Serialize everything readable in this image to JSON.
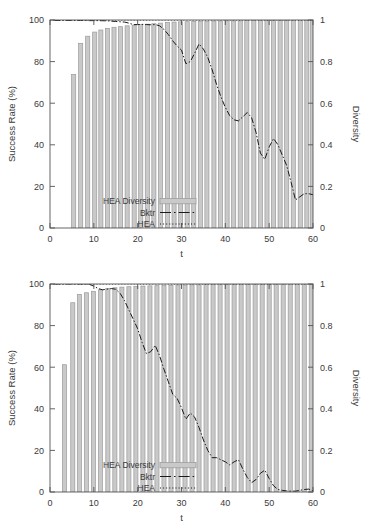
{
  "figure": {
    "background": "#ffffff",
    "bar_fill": "#c9c9c9",
    "bar_stroke": "#9a9a9a",
    "line_color": "#1a1a1a",
    "axis_color": "#555555",
    "text_color": "#3a3a3a"
  },
  "panels": [
    {
      "id": "top-panel",
      "legend": {
        "entries": [
          {
            "label": "HEA Diversity",
            "style": "filled-box"
          },
          {
            "label": "Bktr",
            "style": "dash-dot-line"
          },
          {
            "label": "HEA",
            "style": "dotted-line"
          }
        ]
      },
      "chart_data": {
        "type": "bar",
        "title": "",
        "xlabel": "t",
        "ylabel": "Success Rate (%)",
        "y2label": "Diversity",
        "xlim": [
          0,
          60
        ],
        "ylim": [
          0,
          100
        ],
        "y2lim": [
          0,
          1
        ],
        "xticks": [
          0,
          10,
          20,
          30,
          40,
          50,
          60
        ],
        "yticks": [
          0,
          20,
          40,
          60,
          80,
          100
        ],
        "y2ticks": [
          0,
          0.2,
          0.4,
          0.6,
          0.8,
          1
        ],
        "grid": false,
        "legend_position": "bottom-left",
        "series": [
          {
            "name": "HEA Diversity",
            "type": "bar",
            "axis": "right",
            "x": [
              5.4,
              7,
              8.6,
              10.2,
              11.6,
              13.1,
              14.6,
              16.1,
              17.6,
              19.2,
              20.7,
              22.2,
              23.7,
              25.2,
              26.8,
              28.3,
              29.8,
              31.3,
              32.8,
              34.3,
              35.8,
              37.4,
              38.9,
              40.4,
              41.9,
              43.4,
              44.9,
              46.5,
              48,
              49.5,
              51,
              52.5,
              54,
              55.5,
              57.1,
              58.6,
              59.9
            ],
            "values": [
              0.738,
              0.888,
              0.922,
              0.942,
              0.952,
              0.96,
              0.965,
              0.968,
              0.972,
              0.975,
              0.978,
              0.98,
              0.982,
              0.985,
              0.988,
              0.99,
              0.991,
              0.992,
              0.993,
              0.994,
              0.994,
              0.995,
              0.995,
              0.996,
              0.996,
              0.996,
              0.997,
              0.997,
              0.997,
              0.998,
              0.998,
              0.998,
              0.998,
              0.999,
              0.999,
              0.999,
              0.999
            ]
          },
          {
            "name": "Bktr",
            "type": "line",
            "axis": "right",
            "linestyle": "dash-dot",
            "x": [
              1,
              3,
              5,
              7,
              9,
              11,
              13,
              15,
              17,
              18,
              19,
              20,
              21,
              22,
              23,
              24,
              25,
              26,
              27,
              28,
              29,
              30,
              31,
              32,
              33,
              34,
              35,
              36,
              37,
              38,
              39,
              40,
              41,
              42,
              43,
              44,
              45,
              46,
              47,
              48,
              49,
              50,
              51,
              52,
              53,
              54,
              55,
              56,
              57,
              58,
              59,
              60
            ],
            "values": [
              0.998,
              0.998,
              0.998,
              0.998,
              0.997,
              0.997,
              0.996,
              0.993,
              0.99,
              0.985,
              0.978,
              0.978,
              0.979,
              0.978,
              0.977,
              0.978,
              0.972,
              0.955,
              0.93,
              0.9,
              0.875,
              0.855,
              0.79,
              0.8,
              0.84,
              0.885,
              0.86,
              0.82,
              0.76,
              0.69,
              0.63,
              0.58,
              0.54,
              0.52,
              0.515,
              0.535,
              0.555,
              0.53,
              0.46,
              0.36,
              0.33,
              0.39,
              0.43,
              0.4,
              0.35,
              0.3,
              0.22,
              0.135,
              0.15,
              0.165,
              0.165,
              0.16
            ]
          },
          {
            "name": "HEA",
            "type": "line",
            "axis": "right",
            "linestyle": "dotted",
            "x": [
              0,
              5,
              10,
              15,
              20,
              25,
              30,
              35,
              40,
              45,
              50,
              55,
              60
            ],
            "values": [
              1,
              1,
              1,
              1,
              1,
              1,
              1,
              1,
              1,
              1,
              1,
              1,
              1
            ]
          }
        ]
      }
    },
    {
      "id": "bottom-panel",
      "legend": {
        "entries": [
          {
            "label": "HEA Diversity",
            "style": "filled-box"
          },
          {
            "label": "Bktr",
            "style": "dash-dot-line"
          },
          {
            "label": "HEA",
            "style": "dotted-line"
          }
        ]
      },
      "chart_data": {
        "type": "bar",
        "title": "",
        "xlabel": "t",
        "ylabel": "Success Rate (%)",
        "y2label": "Diversity",
        "xlim": [
          0,
          60
        ],
        "ylim": [
          0,
          100
        ],
        "y2lim": [
          0,
          1
        ],
        "xticks": [
          0,
          10,
          20,
          30,
          40,
          50,
          60
        ],
        "yticks": [
          0,
          20,
          40,
          60,
          80,
          100
        ],
        "y2ticks": [
          0,
          0.2,
          0.4,
          0.6,
          0.8,
          1
        ],
        "grid": false,
        "legend_position": "bottom-left",
        "series": [
          {
            "name": "HEA Diversity",
            "type": "bar",
            "axis": "right",
            "x": [
              3.3,
              5.2,
              6.7,
              8.3,
              9.9,
              11.5,
              13.2,
              14.8,
              16.4,
              18,
              19.6,
              21.2,
              22.8,
              24.4,
              26,
              27.6,
              29.2,
              30.8,
              32.4,
              34,
              35.6,
              37.2,
              38.8,
              40.4,
              42,
              43.6,
              45.2,
              46.8,
              48.4,
              50,
              51.6,
              53.2,
              54.8,
              56.4,
              58,
              59.6
            ],
            "values": [
              0.612,
              0.91,
              0.95,
              0.958,
              0.965,
              0.972,
              0.978,
              0.982,
              0.985,
              0.987,
              0.989,
              0.99,
              0.991,
              0.992,
              0.993,
              0.994,
              0.995,
              0.995,
              0.996,
              0.996,
              0.997,
              0.997,
              0.997,
              0.998,
              0.998,
              0.998,
              0.998,
              0.999,
              0.999,
              0.999,
              0.999,
              0.999,
              1.0,
              1.0,
              1.0,
              1.0
            ]
          },
          {
            "name": "Bktr",
            "type": "line",
            "axis": "right",
            "linestyle": "dash-dot",
            "x": [
              1,
              3,
              5,
              7,
              9,
              10,
              11,
              12,
              13,
              14,
              15,
              16,
              17,
              18,
              19,
              20,
              21,
              22,
              23,
              24,
              25,
              26,
              27,
              28,
              29,
              30,
              31,
              32,
              33,
              34,
              35,
              36,
              37,
              38,
              39,
              40,
              41,
              42,
              43,
              44,
              45,
              46,
              47,
              48,
              49,
              50,
              51,
              52,
              53,
              54,
              55,
              56,
              57,
              58,
              59,
              60
            ],
            "values": [
              1.0,
              1.0,
              1.0,
              1.0,
              0.998,
              0.99,
              0.978,
              0.972,
              0.975,
              0.978,
              0.975,
              0.955,
              0.92,
              0.875,
              0.83,
              0.785,
              0.72,
              0.665,
              0.675,
              0.705,
              0.655,
              0.59,
              0.53,
              0.47,
              0.45,
              0.405,
              0.35,
              0.38,
              0.36,
              0.31,
              0.25,
              0.2,
              0.165,
              0.165,
              0.155,
              0.145,
              0.13,
              0.145,
              0.155,
              0.11,
              0.07,
              0.045,
              0.06,
              0.09,
              0.105,
              0.065,
              0.03,
              0.012,
              0.008,
              0.005,
              0.004,
              0.004,
              0.008,
              0.012,
              0.014,
              0.006
            ]
          },
          {
            "name": "HEA",
            "type": "line",
            "axis": "right",
            "linestyle": "dotted",
            "x": [
              0,
              5,
              10,
              15,
              20,
              25,
              30,
              35,
              40,
              45,
              50,
              55,
              60
            ],
            "values": [
              1,
              1,
              1,
              1,
              1,
              1,
              1,
              1,
              1,
              1,
              1,
              1,
              1
            ]
          }
        ]
      }
    }
  ]
}
